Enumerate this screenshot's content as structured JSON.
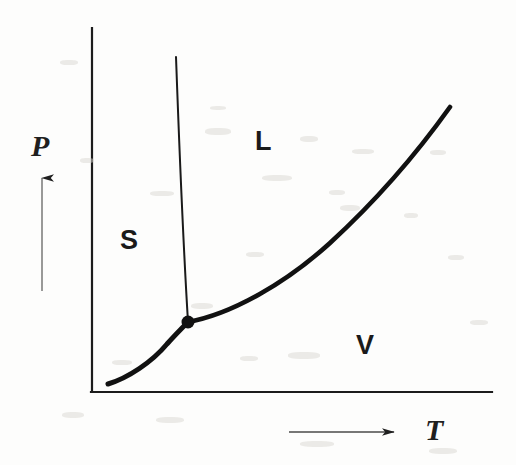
{
  "figure": {
    "kind": "phase-diagram",
    "title": "",
    "background_color": "#fdfdfc",
    "ink_color": "#1a1a1a"
  },
  "axes": {
    "vertical": {
      "name": "pressure-axis",
      "label": "P",
      "label_style": "italic-serif",
      "x": 92,
      "y_top": 28,
      "y_bottom": 392,
      "stroke_width": 2.2,
      "direction_arrow": {
        "name": "pressure-direction-arrow",
        "x": 42,
        "y_tail": 291,
        "y_head": 175,
        "stroke_width": 1.4
      },
      "label_position": {
        "x": 31,
        "y": 131
      }
    },
    "horizontal": {
      "name": "temperature-axis",
      "label": "T",
      "label_style": "italic-serif",
      "y": 392,
      "x_left": 92,
      "x_right": 492,
      "stroke_width": 2.2,
      "direction_arrow": {
        "name": "temperature-direction-arrow",
        "y": 432,
        "x_tail": 289,
        "x_head": 398,
        "stroke_width": 1.4
      },
      "label_position": {
        "x": 425,
        "y": 415
      }
    }
  },
  "regions": [
    {
      "name": "solid-region",
      "label": "S",
      "x": 120,
      "y": 227
    },
    {
      "name": "liquid-region",
      "label": "L",
      "x": 255,
      "y": 128
    },
    {
      "name": "vapor-region",
      "label": "V",
      "x": 356,
      "y": 332
    }
  ],
  "triple_point": {
    "name": "triple-point",
    "label": "",
    "x": 188,
    "y": 322,
    "radius": 6.5,
    "color": "#111111"
  },
  "curves": [
    {
      "name": "sublimation-curve",
      "boundary": "solid-vapor",
      "stroke_width": 5.0,
      "path": "M 108 384 C 128 378, 152 362, 167 344 C 176 334, 183 327, 188 322"
    },
    {
      "name": "fusion-curve",
      "boundary": "solid-liquid",
      "stroke_width": 2.0,
      "path": "M 176 57 C 179 140, 183 240, 188 322"
    },
    {
      "name": "vaporization-curve",
      "boundary": "liquid-vapor",
      "stroke_width": 4.6,
      "path": "M 188 322 C 232 314, 286 283, 330 243 C 378 199, 420 149, 450 107"
    }
  ],
  "chart_data": {
    "type": "line",
    "xlabel": "T",
    "ylabel": "P",
    "grid": false,
    "legend": "none",
    "axis_arrows": true,
    "annotations": [
      {
        "text": "S",
        "meaning": "solid phase region"
      },
      {
        "text": "L",
        "meaning": "liquid phase region"
      },
      {
        "text": "V",
        "meaning": "vapor phase region"
      },
      {
        "text": "",
        "meaning": "triple point marker"
      }
    ],
    "series": [
      {
        "name": "sublimation-curve",
        "points": [
          [
            108,
            384
          ],
          [
            128,
            378
          ],
          [
            147,
            366
          ],
          [
            167,
            344
          ],
          [
            178,
            331
          ],
          [
            188,
            322
          ]
        ]
      },
      {
        "name": "fusion-curve",
        "points": [
          [
            176,
            57
          ],
          [
            178,
            110
          ],
          [
            180,
            165
          ],
          [
            183,
            220
          ],
          [
            185,
            275
          ],
          [
            188,
            322
          ]
        ]
      },
      {
        "name": "vaporization-curve",
        "points": [
          [
            188,
            322
          ],
          [
            232,
            311
          ],
          [
            272,
            291
          ],
          [
            310,
            262
          ],
          [
            348,
            224
          ],
          [
            388,
            178
          ],
          [
            420,
            143
          ],
          [
            450,
            107
          ]
        ]
      }
    ],
    "markers": [
      {
        "name": "triple-point",
        "x": 188,
        "y": 322
      }
    ]
  },
  "artifacts": {
    "description": "faint scanned-page bleed-through specks",
    "specks": [
      [
        205,
        128,
        26,
        7
      ],
      [
        300,
        136,
        18,
        6
      ],
      [
        352,
        149,
        22,
        5
      ],
      [
        430,
        150,
        16,
        5
      ],
      [
        80,
        158,
        14,
        5
      ],
      [
        262,
        175,
        30,
        6
      ],
      [
        150,
        191,
        24,
        5
      ],
      [
        329,
        190,
        16,
        5
      ],
      [
        340,
        205,
        20,
        6
      ],
      [
        404,
        213,
        14,
        5
      ],
      [
        246,
        252,
        18,
        5
      ],
      [
        191,
        303,
        22,
        6
      ],
      [
        448,
        255,
        16,
        5
      ],
      [
        288,
        352,
        32,
        7
      ],
      [
        112,
        360,
        20,
        5
      ],
      [
        240,
        356,
        18,
        5
      ],
      [
        62,
        412,
        22,
        6
      ],
      [
        156,
        417,
        28,
        6
      ],
      [
        300,
        441,
        34,
        6
      ],
      [
        429,
        448,
        28,
        6
      ],
      [
        60,
        60,
        18,
        5
      ],
      [
        470,
        320,
        18,
        5
      ],
      [
        210,
        106,
        16,
        4
      ]
    ]
  }
}
